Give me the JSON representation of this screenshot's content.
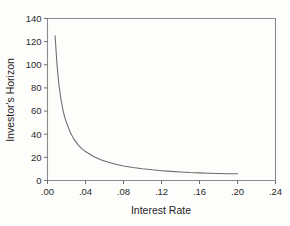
{
  "chart_data": {
    "type": "line",
    "title": "",
    "xlabel": "Interest Rate",
    "ylabel": "Investor's Horizon",
    "xlim": [
      0.0,
      0.24
    ],
    "ylim": [
      0,
      140
    ],
    "grid": false,
    "legend": null,
    "xticks": [
      0.0,
      0.04,
      0.08,
      0.12,
      0.16,
      0.2,
      0.24
    ],
    "xtick_labels": [
      ".00",
      ".04",
      ".08",
      ".12",
      ".16",
      ".20",
      ".24"
    ],
    "yticks": [
      0,
      20,
      40,
      60,
      80,
      100,
      120,
      140
    ],
    "ytick_labels": [
      "0",
      "20",
      "40",
      "60",
      "80",
      "100",
      "120",
      "140"
    ],
    "series": [
      {
        "name": "Investor's Horizon",
        "color": "#6b6b6b",
        "x": [
          0.008,
          0.01,
          0.012,
          0.014,
          0.016,
          0.018,
          0.02,
          0.024,
          0.028,
          0.032,
          0.036,
          0.04,
          0.048,
          0.056,
          0.064,
          0.072,
          0.08,
          0.09,
          0.1,
          0.11,
          0.12,
          0.13,
          0.14,
          0.15,
          0.16,
          0.17,
          0.18,
          0.19,
          0.2
        ],
        "y": [
          125.0,
          100.0,
          83.0,
          71.0,
          62.0,
          55.0,
          50.0,
          41.5,
          35.5,
          31.0,
          27.5,
          25.0,
          21.0,
          18.0,
          15.7,
          14.0,
          12.5,
          11.2,
          10.1,
          9.2,
          8.5,
          7.9,
          7.4,
          6.9,
          6.6,
          6.3,
          6.1,
          5.9,
          5.8
        ]
      }
    ]
  },
  "axis_titles": {
    "x": "Interest Rate",
    "y": "Investor's Horizon"
  }
}
